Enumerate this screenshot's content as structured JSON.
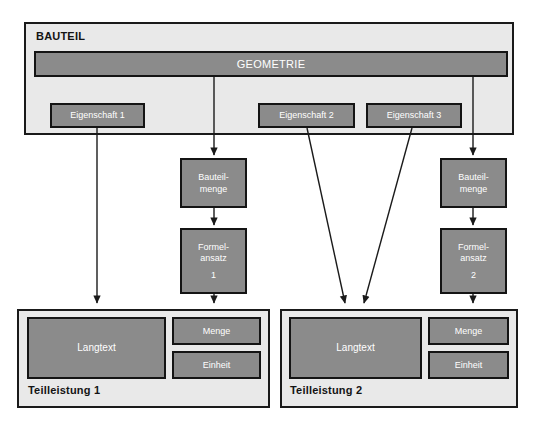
{
  "diagram": {
    "type": "block-diagram",
    "background_color": "#ffffff",
    "palette": {
      "box_fill": "#8b8b8b",
      "container_fill": "#e9e9e9",
      "outline": "#141414",
      "box_text": "#ffffff",
      "container_text": "#141414"
    },
    "bauteil": {
      "title": "BAUTEIL",
      "geometrie": {
        "label": "GEOMETRIE"
      },
      "eigenschaften": [
        {
          "label": "Eigenschaft 1"
        },
        {
          "label": "Eigenschaft 2"
        },
        {
          "label": "Eigenschaft 3"
        }
      ]
    },
    "columns": [
      {
        "id": "column-left",
        "bauteilmenge": {
          "line1": "Bauteil-",
          "line2": "menge"
        },
        "formelansatz": {
          "line1": "Formel-",
          "line2": "ansatz",
          "number": "1"
        }
      },
      {
        "id": "column-right",
        "bauteilmenge": {
          "line1": "Bauteil-",
          "line2": "menge"
        },
        "formelansatz": {
          "line1": "Formel-",
          "line2": "ansatz",
          "number": "2"
        }
      }
    ],
    "teilleistungen": [
      {
        "title": "Teilleistung 1",
        "langtext": "Langtext",
        "menge": "Menge",
        "einheit": "Einheit"
      },
      {
        "title": "Teilleistung 2",
        "langtext": "Langtext",
        "menge": "Menge",
        "einheit": "Einheit"
      }
    ]
  }
}
